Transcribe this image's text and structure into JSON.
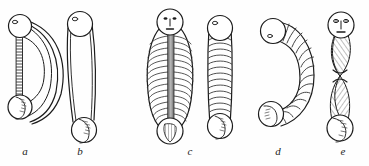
{
  "plate": {
    "background_color": "#fefefe",
    "ink_color": "#1b1b1b",
    "shade_color": "#8d8d8d",
    "light_shade_color": "#c9c9c9",
    "captions": [
      {
        "key": "a",
        "label": "a"
      },
      {
        "key": "b",
        "label": "b"
      },
      {
        "key": "c",
        "label": "c"
      },
      {
        "key": "d",
        "label": "d"
      },
      {
        "key": "e",
        "label": "e"
      }
    ],
    "figures": [
      {
        "key": "a",
        "label": "a",
        "name": "bent-ribbed-body-with-terminal-spheres",
        "description": "Curved crescent body with a narrow hatched strip on the left and spheres at both ends"
      },
      {
        "key": "b",
        "label": "b",
        "name": "elongated-smooth-tube-with-terminal-spheres",
        "description": "Long slender outlined tube with a sphere at top and bottom"
      },
      {
        "key": "c",
        "label": "c",
        "name": "ribbed-body-with-face-and-narrow-ribbed-tube",
        "description": "Broad ribbed oval with a human face and central grey stripe, beside a narrow ribbed tube"
      },
      {
        "key": "d",
        "label": "d",
        "name": "c-shaped-segmented-body",
        "description": "C-shaped segmented worm-like body with spheres at both ends"
      },
      {
        "key": "e",
        "label": "e",
        "name": "twisted-helical-body-with-face",
        "description": "Twisted double-lobed helical body with a human face at the top sphere"
      }
    ]
  }
}
